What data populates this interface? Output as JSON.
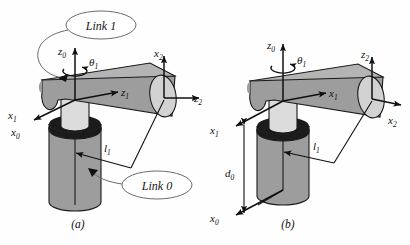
{
  "figure": {
    "background_color": "#fefefe",
    "ink_color": "#101010",
    "colors": {
      "link_body": "#9d9d9d",
      "link_body_dark": "#8a8a8a",
      "link_top_face": "#b4b4b4",
      "neck": "#dcdcdc",
      "collar": "#1b1b1b",
      "end_cap": "#d2d2d2",
      "callout_fill": "#ffffff",
      "outline": "#1a1a1a"
    },
    "panels": [
      {
        "id": "a",
        "caption": "(a)",
        "axes": [
          {
            "name": "z0",
            "label": "z",
            "subscript": "0",
            "direction": "up"
          },
          {
            "name": "x0",
            "label": "x",
            "subscript": "0",
            "direction": "down-left"
          },
          {
            "name": "x1",
            "label": "x",
            "subscript": "1",
            "direction": "down-left"
          },
          {
            "name": "z1",
            "label": "z",
            "subscript": "1",
            "direction": "right"
          },
          {
            "name": "x2",
            "label": "x",
            "subscript": "2",
            "direction": "up"
          },
          {
            "name": "z2",
            "label": "z",
            "subscript": "2",
            "direction": "right"
          }
        ],
        "joint_variable": {
          "name": "theta1",
          "label": "θ",
          "subscript": "1",
          "type": "revolute"
        },
        "dimensions": [
          {
            "name": "l1",
            "label": "l",
            "subscript": "1",
            "kind": "link-length"
          }
        ],
        "callouts": [
          {
            "name": "link-1",
            "text": "Link 1"
          },
          {
            "name": "link-0",
            "text": "Link 0"
          }
        ]
      },
      {
        "id": "b",
        "caption": "(b)",
        "axes": [
          {
            "name": "z0",
            "label": "z",
            "subscript": "0",
            "direction": "up"
          },
          {
            "name": "x1",
            "label": "x",
            "subscript": "1",
            "direction": "down-left"
          },
          {
            "name": "z1",
            "label": "z",
            "subscript": "1",
            "direction": "right"
          },
          {
            "name": "x0",
            "label": "x",
            "subscript": "0",
            "direction": "down-left"
          },
          {
            "name": "z2",
            "label": "z",
            "subscript": "2",
            "direction": "up"
          },
          {
            "name": "x2",
            "label": "x",
            "subscript": "2",
            "direction": "right"
          }
        ],
        "joint_variable": {
          "name": "theta1",
          "label": "θ",
          "subscript": "1",
          "type": "revolute"
        },
        "dimensions": [
          {
            "name": "l1",
            "label": "l",
            "subscript": "1",
            "kind": "link-length"
          },
          {
            "name": "d0",
            "label": "d",
            "subscript": "0",
            "kind": "offset"
          }
        ],
        "callouts": []
      }
    ]
  }
}
